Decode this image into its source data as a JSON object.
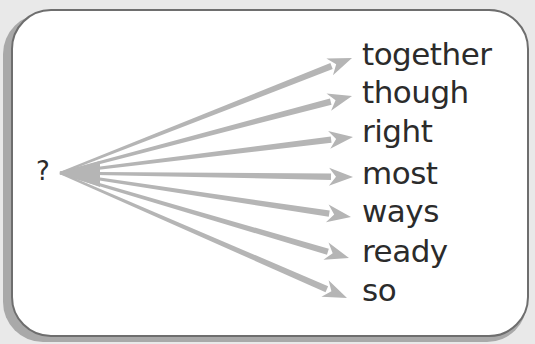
{
  "diagram": {
    "source_label": "?",
    "arrow_color": "#b5b5b5",
    "text_color": "#2b2b2b",
    "origin": {
      "x": 60,
      "y": 173
    },
    "targets": [
      {
        "word": "together",
        "tip": {
          "x": 352,
          "y": 58
        },
        "top": 36
      },
      {
        "word": "though",
        "tip": {
          "x": 352,
          "y": 96
        },
        "top": 74
      },
      {
        "word": "right",
        "tip": {
          "x": 353,
          "y": 137
        },
        "top": 113
      },
      {
        "word": "most",
        "tip": {
          "x": 353,
          "y": 177
        },
        "top": 155
      },
      {
        "word": "ways",
        "tip": {
          "x": 351,
          "y": 217
        },
        "top": 193
      },
      {
        "word": "ready",
        "tip": {
          "x": 349,
          "y": 258
        },
        "top": 233
      },
      {
        "word": "so",
        "tip": {
          "x": 347,
          "y": 298
        },
        "top": 272
      }
    ]
  }
}
